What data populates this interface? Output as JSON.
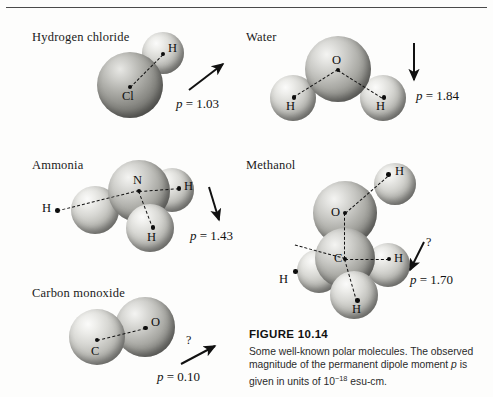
{
  "figure": {
    "number": "FIGURE 10.14",
    "caption_part1": "Some well-known polar molecules. The observed magnitude of the permanent dipole moment ",
    "caption_symbol": "p",
    "caption_part2": " is given in units of 10",
    "caption_exponent": "−18",
    "caption_part3": " esu-cm."
  },
  "molecules": {
    "hcl": {
      "name": "Hydrogen chloride",
      "atoms": {
        "cl": "Cl",
        "h": "H"
      },
      "dipole": {
        "symbol": "p",
        "equals": " = ",
        "value": "1.03"
      }
    },
    "water": {
      "name": "Water",
      "atoms": {
        "o": "O",
        "h1": "H",
        "h2": "H"
      },
      "dipole": {
        "symbol": "p",
        "equals": " = ",
        "value": "1.84"
      }
    },
    "ammonia": {
      "name": "Ammonia",
      "atoms": {
        "n": "N",
        "h1": "H",
        "h2": "H",
        "h3": "H"
      },
      "dipole": {
        "symbol": "p",
        "equals": " = ",
        "value": "1.43"
      }
    },
    "methanol": {
      "name": "Methanol",
      "atoms": {
        "o": "O",
        "c": "C",
        "h_oh": "H",
        "h_right": "H",
        "h_left": "H",
        "h_bottom": "H"
      },
      "dipole": {
        "symbol": "p",
        "equals": " = ",
        "value": "1.70"
      },
      "uncertain_marker": "?"
    },
    "co": {
      "name": "Carbon monoxide",
      "atoms": {
        "c": "C",
        "o": "O"
      },
      "dipole": {
        "symbol": "p",
        "equals": " = ",
        "value": "0.10"
      },
      "uncertain_marker": "?"
    }
  },
  "colors": {
    "ink": "#111111",
    "rule": "#4a4a4a",
    "background": "#fdfdfc"
  }
}
